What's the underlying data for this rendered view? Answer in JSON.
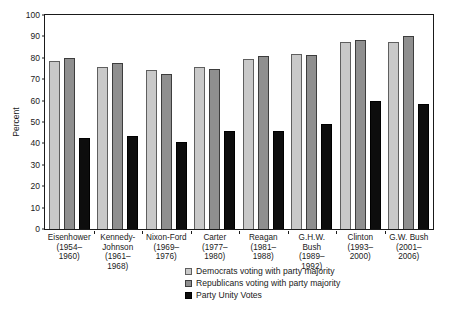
{
  "chart_data": {
    "type": "bar",
    "title": "",
    "xlabel": "",
    "ylabel": "Percent",
    "ylim": [
      0,
      100
    ],
    "yticks": [
      100,
      90,
      80,
      70,
      60,
      50,
      40,
      30,
      20,
      10,
      0
    ],
    "grid": false,
    "legend_position": "bottom-center",
    "categories": [
      "Eisenhower\n(1954–\n1960)",
      "Kennedy-\nJohnson\n(1961–\n1968)",
      "Nixon-Ford\n(1969–\n1976)",
      "Carter\n(1977–\n1980)",
      "Reagan\n(1981–\n1988)",
      "G.H.W. Bush\n(1989–\n1992)",
      "Clinton\n(1993–\n2000)",
      "G.W. Bush\n(2001–\n2006)"
    ],
    "series": [
      {
        "name": "Democrats voting with party majority",
        "color": "#c9c9c9",
        "values": [
          78.5,
          75.5,
          74.5,
          75.5,
          79.5,
          82.0,
          87.5,
          87.5
        ]
      },
      {
        "name": "Republicans voting with party majority",
        "color": "#8f8f8f",
        "values": [
          80.0,
          77.5,
          72.5,
          75.0,
          81.0,
          81.5,
          88.5,
          90.0
        ]
      },
      {
        "name": "Party Unity Votes",
        "color": "#0d0d0d",
        "values": [
          42.5,
          43.5,
          40.5,
          46.0,
          46.0,
          49.0,
          60.0,
          58.5
        ]
      }
    ]
  },
  "axis": {
    "y_title": "Percent",
    "tick_labels": [
      "100",
      "90",
      "80",
      "70",
      "60",
      "50",
      "40",
      "30",
      "20",
      "10",
      "0"
    ]
  },
  "legend": {
    "items": [
      {
        "label": "Democrats voting with party majority",
        "swatch": "dem-swatch-icon"
      },
      {
        "label": "Republicans voting with party majority",
        "swatch": "rep-swatch-icon"
      },
      {
        "label": "Party Unity Votes",
        "swatch": "unity-swatch-icon"
      }
    ]
  }
}
